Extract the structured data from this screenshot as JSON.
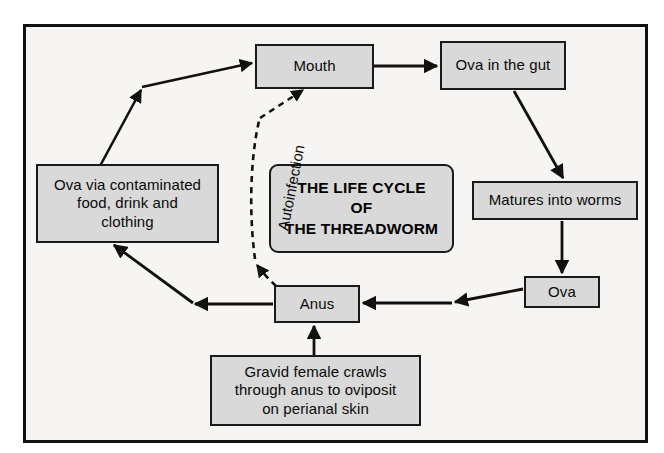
{
  "diagram": {
    "title": "THE LIFE CYCLE\nOF\nTHE THREADWORM",
    "title_line1": "THE LIFE CYCLE",
    "title_line2": "OF",
    "title_line3": "THE THREADWORM",
    "background_color": "#f6f5f3",
    "node_fill_color": "#d9d9d9",
    "stroke_color": "#1a1a1a",
    "nodes": {
      "mouth": "Mouth",
      "ova_in_gut": "Ova in the gut",
      "matures_into_worms": "Matures into worms",
      "ova": "Ova",
      "anus": "Anus",
      "gravid_female_line1": "Gravid female crawls",
      "gravid_female_line2": "through anus to oviposit",
      "gravid_female_line3": "on perianal skin",
      "ova_contaminated_line1": "Ova via contaminated",
      "ova_contaminated_line2": "food, drink and",
      "ova_contaminated_line3": "clothing"
    },
    "edge_labels": {
      "autoinfection": "Autoinfection"
    }
  }
}
